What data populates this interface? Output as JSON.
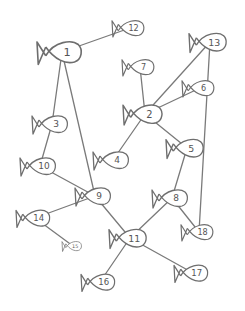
{
  "diagram": {
    "type": "hand-drawn graph",
    "node_shape": "fish",
    "colors": {
      "stroke": "#6e6e6e",
      "edge": "#7a7a7a",
      "label": "#555555",
      "background": "#ffffff"
    },
    "nodes": [
      {
        "id": "1",
        "label": "1",
        "x": 62,
        "y": 52,
        "size": 1.25
      },
      {
        "id": "2",
        "label": "2",
        "x": 145,
        "y": 114,
        "size": 1.1
      },
      {
        "id": "3",
        "label": "3",
        "x": 52,
        "y": 124,
        "size": 1.0
      },
      {
        "id": "4",
        "label": "4",
        "x": 113,
        "y": 160,
        "size": 1.0
      },
      {
        "id": "5",
        "label": "5",
        "x": 187,
        "y": 148,
        "size": 1.05
      },
      {
        "id": "6",
        "label": "6",
        "x": 200,
        "y": 88,
        "size": 0.9
      },
      {
        "id": "7",
        "label": "7",
        "x": 140,
        "y": 67,
        "size": 0.9
      },
      {
        "id": "8",
        "label": "8",
        "x": 172,
        "y": 198,
        "size": 1.0
      },
      {
        "id": "9",
        "label": "9",
        "x": 95,
        "y": 196,
        "size": 1.0
      },
      {
        "id": "10",
        "label": "10",
        "x": 40,
        "y": 166,
        "size": 1.0
      },
      {
        "id": "11",
        "label": "11",
        "x": 130,
        "y": 238,
        "size": 1.05
      },
      {
        "id": "12",
        "label": "12",
        "x": 130,
        "y": 28,
        "size": 0.9
      },
      {
        "id": "13",
        "label": "13",
        "x": 210,
        "y": 42,
        "size": 1.05
      },
      {
        "id": "14",
        "label": "14",
        "x": 35,
        "y": 218,
        "size": 0.95
      },
      {
        "id": "15",
        "label": "15",
        "x": 73,
        "y": 246,
        "size": 0.55
      },
      {
        "id": "16",
        "label": "16",
        "x": 100,
        "y": 282,
        "size": 0.95
      },
      {
        "id": "17",
        "label": "17",
        "x": 193,
        "y": 273,
        "size": 0.95
      },
      {
        "id": "18",
        "label": "18",
        "x": 199,
        "y": 232,
        "size": 0.9
      }
    ],
    "edges": [
      [
        "1",
        "12"
      ],
      [
        "1",
        "3"
      ],
      [
        "1",
        "9"
      ],
      [
        "3",
        "10"
      ],
      [
        "10",
        "9"
      ],
      [
        "9",
        "14"
      ],
      [
        "9",
        "11"
      ],
      [
        "14",
        "15"
      ],
      [
        "7",
        "2"
      ],
      [
        "2",
        "13"
      ],
      [
        "2",
        "6"
      ],
      [
        "2",
        "4"
      ],
      [
        "2",
        "5"
      ],
      [
        "5",
        "8"
      ],
      [
        "8",
        "18"
      ],
      [
        "8",
        "11"
      ],
      [
        "13",
        "18"
      ],
      [
        "11",
        "16"
      ],
      [
        "11",
        "17"
      ]
    ]
  }
}
